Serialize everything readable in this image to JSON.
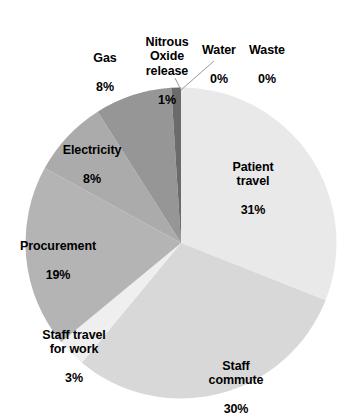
{
  "chart_data": {
    "type": "pie",
    "title": "",
    "subtitle": "",
    "xlabel": "",
    "ylabel": "",
    "legend_position": "none",
    "grid": false,
    "labels_show_percent": true,
    "start_angle_deg": 0,
    "direction": "clockwise",
    "categories": [
      "Water",
      "Waste",
      "Patient travel",
      "Staff commute",
      "Staff travel for work",
      "Procurement",
      "Electricity",
      "Gas",
      "Nitrous Oxide release"
    ],
    "values": [
      0,
      0,
      31,
      30,
      3,
      19,
      8,
      8,
      1
    ],
    "units": "percent",
    "colors": [
      "#f2f2f2",
      "#f2f2f2",
      "#e9e9e9",
      "#d8d8d8",
      "#efefef",
      "#b4b4b4",
      "#ababab",
      "#969696",
      "#6b6b6b"
    ],
    "slices": [
      {
        "name": "Water",
        "value": 0,
        "percent_label": "0%",
        "color": "#f2f2f2"
      },
      {
        "name": "Waste",
        "value": 0,
        "percent_label": "0%",
        "color": "#f2f2f2"
      },
      {
        "name": "Patient travel",
        "value": 31,
        "percent_label": "31%",
        "color": "#e9e9e9"
      },
      {
        "name": "Staff commute",
        "value": 30,
        "percent_label": "30%",
        "color": "#d8d8d8"
      },
      {
        "name": "Staff travel for work",
        "value": 3,
        "percent_label": "3%",
        "color": "#efefef"
      },
      {
        "name": "Procurement",
        "value": 19,
        "percent_label": "19%",
        "color": "#b4b4b4"
      },
      {
        "name": "Electricity",
        "value": 8,
        "percent_label": "8%",
        "color": "#ababab"
      },
      {
        "name": "Gas",
        "value": 8,
        "percent_label": "8%",
        "color": "#969696"
      },
      {
        "name": "Nitrous Oxide release",
        "value": 1,
        "percent_label": "1%",
        "color": "#6b6b6b"
      }
    ]
  },
  "labels": {
    "gas": {
      "name": "Gas",
      "value": "8%"
    },
    "nitrous": {
      "name": "Nitrous\nOxide\nrelease",
      "value": "1%"
    },
    "water": {
      "name": "Water",
      "value": "0%"
    },
    "waste": {
      "name": "Waste",
      "value": "0%"
    },
    "patient": {
      "name": "Patient\ntravel",
      "value": "31%"
    },
    "staff_commute": {
      "name": "Staff\ncommute",
      "value": "30%"
    },
    "staff_work": {
      "name": "Staff travel\nfor work",
      "value": "3%"
    },
    "procurement": {
      "name": "Procurement",
      "value": "19%"
    },
    "electricity": {
      "name": "Electricity",
      "value": "8%"
    }
  }
}
